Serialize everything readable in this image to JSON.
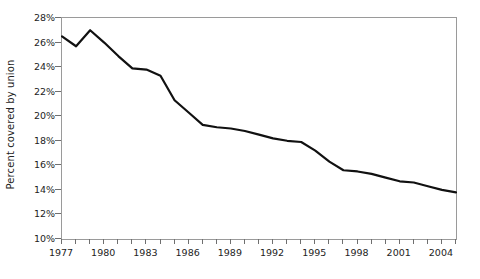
{
  "chart_data": {
    "type": "line",
    "title": "",
    "subtitle": "",
    "xlabel": "",
    "ylabel": "Percent covered by union",
    "xlim": [
      1977,
      2005
    ],
    "ylim": [
      10,
      28
    ],
    "grid": false,
    "legend": "none",
    "y_tick_labels": [
      "28%",
      "26%",
      "24%",
      "22%",
      "20%",
      "18%",
      "16%",
      "14%",
      "12%",
      "10%"
    ],
    "y_tick_values": [
      28,
      26,
      24,
      22,
      20,
      18,
      16,
      14,
      12,
      10
    ],
    "x_tick_values": [
      1977,
      1978,
      1979,
      1980,
      1981,
      1982,
      1983,
      1984,
      1985,
      1986,
      1987,
      1988,
      1989,
      1990,
      1991,
      1992,
      1993,
      1994,
      1995,
      1996,
      1997,
      1998,
      1999,
      2000,
      2001,
      2002,
      2003,
      2004,
      2005
    ],
    "x_tick_labels_shown": [
      "1977",
      "1980",
      "1983",
      "1986",
      "1989",
      "1992",
      "1995",
      "1998",
      "2001",
      "2004"
    ],
    "x_tick_labels_shown_values": [
      1977,
      1980,
      1983,
      1986,
      1989,
      1992,
      1995,
      1998,
      2001,
      2004
    ],
    "line_color": "#111111",
    "axis_color": "#9a9a9a",
    "x": [
      1977,
      1978,
      1979,
      1980,
      1981,
      1982,
      1983,
      1984,
      1985,
      1986,
      1987,
      1988,
      1989,
      1990,
      1991,
      1992,
      1993,
      1994,
      1995,
      1996,
      1997,
      1998,
      1999,
      2000,
      2001,
      2002,
      2003,
      2004,
      2005
    ],
    "values": [
      26.5,
      25.7,
      27.0,
      26.0,
      24.9,
      23.9,
      23.8,
      23.3,
      21.3,
      20.3,
      19.3,
      19.1,
      19.0,
      18.8,
      18.5,
      18.2,
      18.0,
      17.9,
      17.2,
      16.3,
      15.6,
      15.5,
      15.3,
      15.0,
      14.7,
      14.6,
      14.3,
      14.0,
      13.8
    ],
    "value_labels_visible": false
  }
}
